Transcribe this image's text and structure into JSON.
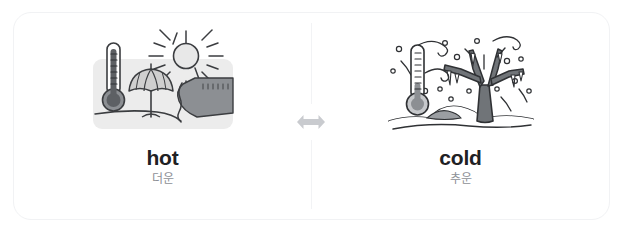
{
  "card": {
    "name": "antonym-pair-card",
    "accent_color": "#c9cbcf",
    "text_color": "#1f2124",
    "gloss_color": "#8d9096",
    "border_color": "#f1f2f4"
  },
  "center": {
    "icon": "swap-horizontal-arrows-icon",
    "arrow_color": "#c9cbcf"
  },
  "pairs": [
    {
      "id": "hot",
      "term": "hot",
      "gloss": "더운",
      "illustration": {
        "name": "hot-weather-illustration",
        "alt": "thermometer, beach umbrella and sun over a shoreline",
        "background": "#ececec",
        "elements": [
          "thermometer",
          "beach-umbrella",
          "sun",
          "shore",
          "sand"
        ]
      }
    },
    {
      "id": "cold",
      "term": "cold",
      "gloss": "추운",
      "illustration": {
        "name": "cold-weather-illustration",
        "alt": "thermometer, bare tree with icicles, snow hills and wind swirls",
        "background": "#ffffff",
        "elements": [
          "thermometer",
          "bare-tree",
          "icicles",
          "snow-hills",
          "snowflakes",
          "wind-swirls"
        ]
      }
    }
  ]
}
